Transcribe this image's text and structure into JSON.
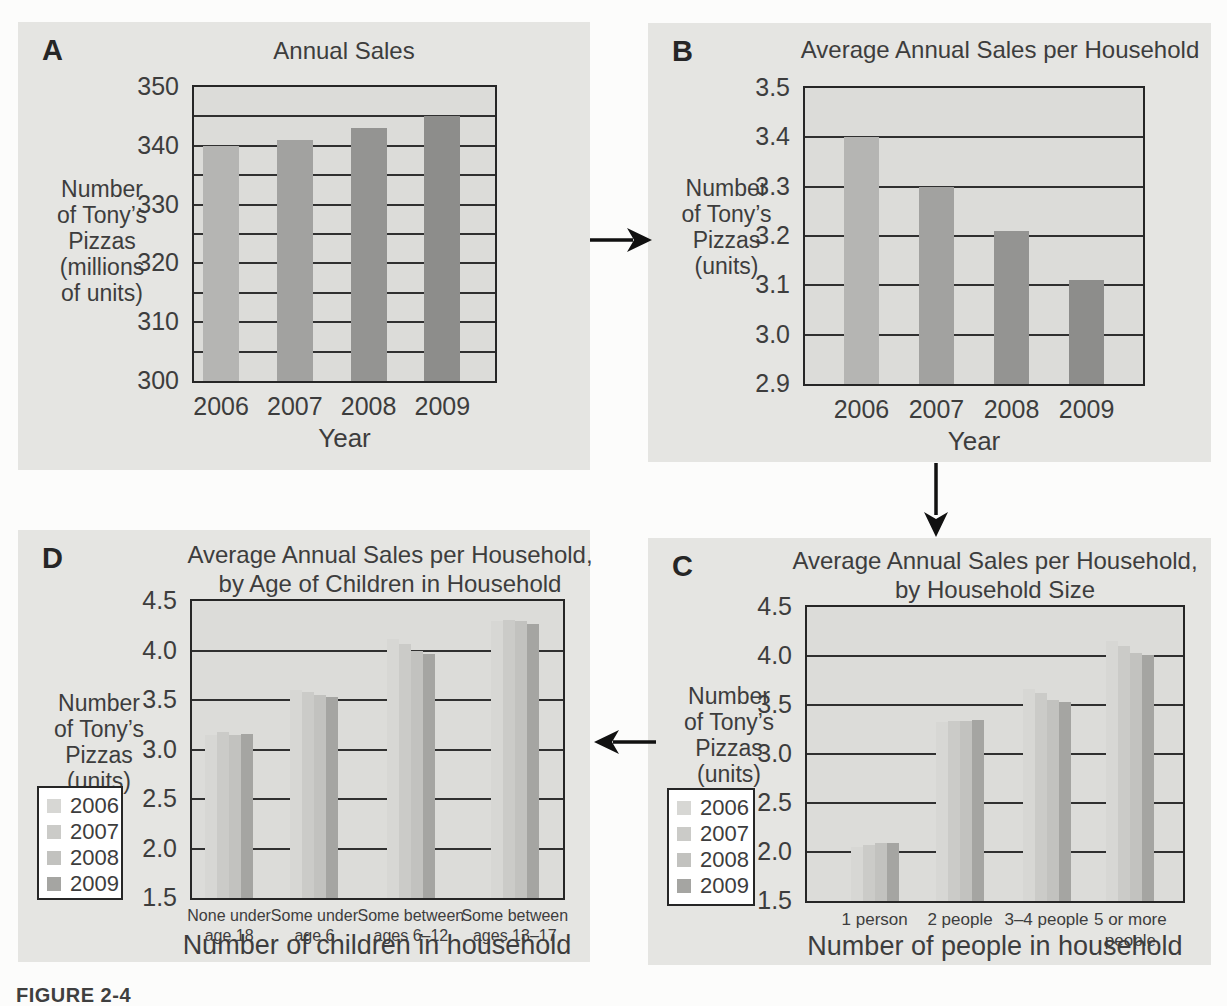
{
  "figure": {
    "caption": "FIGURE 2-4"
  },
  "colors": {
    "panel_bg": "#e5e5e2",
    "plot_bg": "#dcdcd9",
    "line": "#303030",
    "single_series_bars": [
      "#b5b5b3",
      "#a2a2a0",
      "#949492",
      "#8d8d8b"
    ],
    "grouped_bars": [
      "#d7d7d4",
      "#cbcbc8",
      "#c2c2bf",
      "#a5a5a2"
    ]
  },
  "chart_data": [
    {
      "id": "A",
      "type": "bar",
      "panel_letter": "A",
      "title_lines": [
        "Annual Sales"
      ],
      "ylabel_lines": [
        "Number",
        "of Tony’s",
        "Pizzas",
        "(millions",
        "of units)"
      ],
      "xlabel": "Year",
      "categories": [
        "2006",
        "2007",
        "2008",
        "2009"
      ],
      "values": [
        340,
        341,
        343,
        345
      ],
      "ylim": [
        300,
        350
      ],
      "grid_step": 5,
      "label_step": 10,
      "tick_decimals": 0,
      "grid": true,
      "legend_position": "none"
    },
    {
      "id": "B",
      "type": "bar",
      "panel_letter": "B",
      "title_lines": [
        "Average Annual Sales per Household"
      ],
      "ylabel_lines": [
        "Number",
        "of Tony’s",
        "Pizzas",
        "(units)"
      ],
      "xlabel": "Year",
      "categories": [
        "2006",
        "2007",
        "2008",
        "2009"
      ],
      "values": [
        3.4,
        3.3,
        3.21,
        3.11
      ],
      "ylim": [
        2.9,
        3.5
      ],
      "grid_step": 0.1,
      "label_step": 0.1,
      "tick_decimals": 1,
      "grid": true,
      "legend_position": "none"
    },
    {
      "id": "C",
      "type": "bar",
      "panel_letter": "C",
      "title_lines": [
        "Average Annual Sales per Household,",
        "by Household Size"
      ],
      "ylabel_lines": [
        "Number",
        "of Tony’s",
        "Pizzas",
        "(units)"
      ],
      "xlabel": "Number of people in household",
      "categories": [
        [
          "1 person"
        ],
        [
          "2 people"
        ],
        [
          "3–4 people"
        ],
        [
          "5 or more",
          "people"
        ]
      ],
      "legend": [
        "2006",
        "2007",
        "2008",
        "2009"
      ],
      "series": [
        {
          "name": "2006",
          "values": [
            2.05,
            3.33,
            3.66,
            4.15
          ]
        },
        {
          "name": "2007",
          "values": [
            2.07,
            3.34,
            3.62,
            4.1
          ]
        },
        {
          "name": "2008",
          "values": [
            2.09,
            3.34,
            3.55,
            4.03
          ]
        },
        {
          "name": "2009",
          "values": [
            2.09,
            3.35,
            3.53,
            4.01
          ]
        }
      ],
      "ylim": [
        1.5,
        4.5
      ],
      "grid_step": 0.5,
      "label_step": 0.5,
      "tick_decimals": 1,
      "grid": true,
      "legend_position": "left"
    },
    {
      "id": "D",
      "type": "bar",
      "panel_letter": "D",
      "title_lines": [
        "Average Annual Sales per Household,",
        "by Age of Children in Household"
      ],
      "ylabel_lines": [
        "Number",
        "of Tony’s",
        "Pizzas",
        "(units)"
      ],
      "xlabel": "Number of children in household",
      "categories": [
        [
          "None under",
          "age 18"
        ],
        [
          "Some under",
          "age 6"
        ],
        [
          "Some between",
          "ages 6–12"
        ],
        [
          "Some between",
          "ages 13–17"
        ]
      ],
      "legend": [
        "2006",
        "2007",
        "2008",
        "2009"
      ],
      "series": [
        {
          "name": "2006",
          "values": [
            3.15,
            3.6,
            4.12,
            4.3
          ]
        },
        {
          "name": "2007",
          "values": [
            3.18,
            3.58,
            4.07,
            4.31
          ]
        },
        {
          "name": "2008",
          "values": [
            3.15,
            3.55,
            4.0,
            4.3
          ]
        },
        {
          "name": "2009",
          "values": [
            3.16,
            3.53,
            3.96,
            4.27
          ]
        }
      ],
      "ylim": [
        1.5,
        4.5
      ],
      "grid_step": 0.5,
      "label_step": 0.5,
      "tick_decimals": 1,
      "grid": true,
      "legend_position": "left"
    }
  ]
}
